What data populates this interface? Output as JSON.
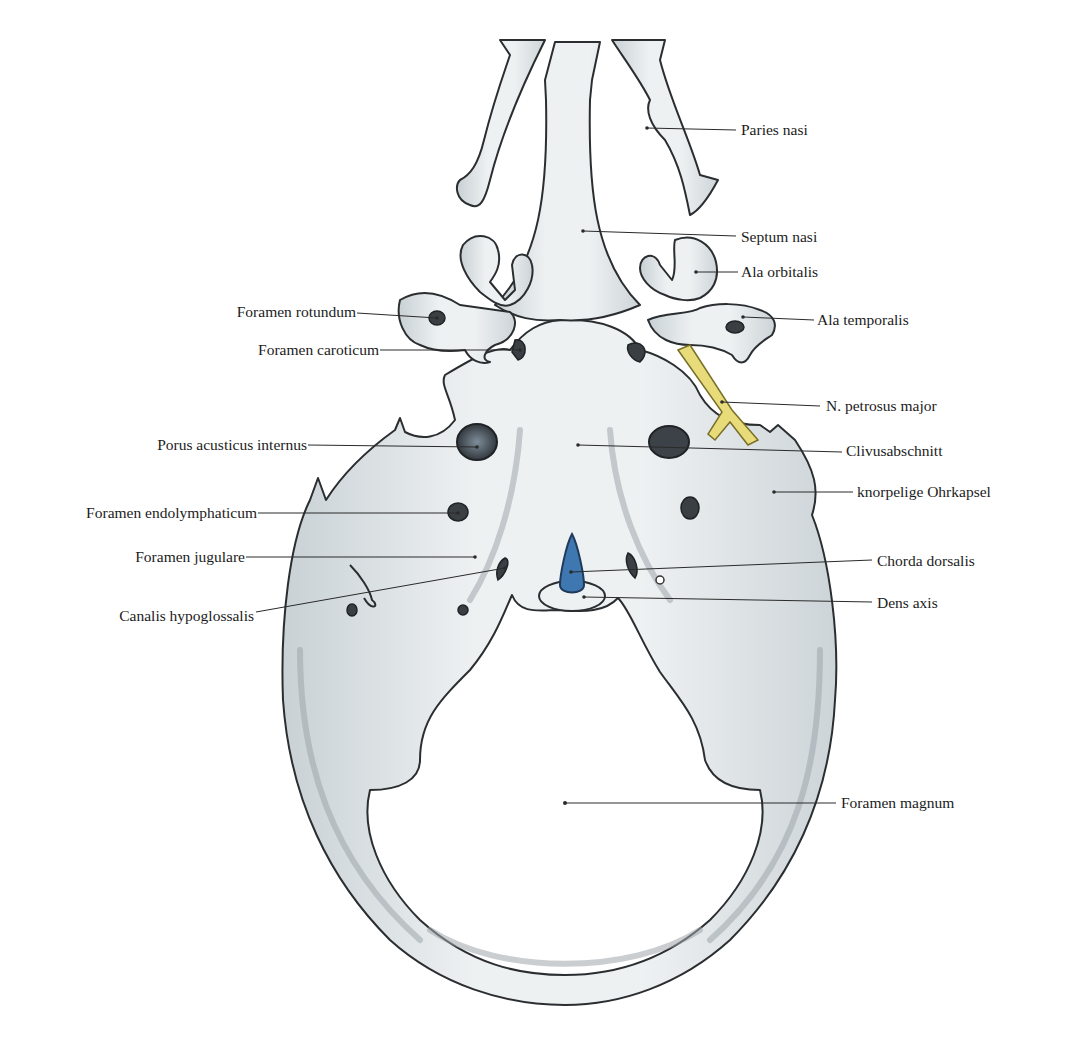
{
  "figure": {
    "colors": {
      "background": "#ffffff",
      "cartilage": "#e7ebed",
      "cartilage_shadow": "#b9c2c7",
      "outline": "#2b2e30",
      "nerve_yellow": "#e8dc7a",
      "chorda_blue": "#3f77b0",
      "label_text": "#1c1c1c"
    }
  },
  "labels": {
    "left": [
      {
        "id": "foramen-rotundum",
        "text": "Foramen rotundum"
      },
      {
        "id": "foramen-caroticum",
        "text": "Foramen caroticum"
      },
      {
        "id": "porus-acusticus-internus",
        "text": "Porus acusticus internus"
      },
      {
        "id": "foramen-endolymphaticum",
        "text": "Foramen endolymphaticum"
      },
      {
        "id": "foramen-jugulare",
        "text": "Foramen jugulare"
      },
      {
        "id": "canalis-hypoglossalis",
        "text": "Canalis hypoglossalis"
      }
    ],
    "right": [
      {
        "id": "paries-nasi",
        "text": "Paries nasi"
      },
      {
        "id": "septum-nasi",
        "text": "Septum nasi"
      },
      {
        "id": "ala-orbitalis",
        "text": "Ala orbitalis"
      },
      {
        "id": "ala-temporalis",
        "text": "Ala temporalis"
      },
      {
        "id": "n-petrosus-major",
        "text": "N. petrosus major"
      },
      {
        "id": "clivusabschnitt",
        "text": "Clivusabschnitt"
      },
      {
        "id": "knorpelige-ohrkapsel",
        "text": "knorpelige Ohrkapsel"
      },
      {
        "id": "chorda-dorsalis",
        "text": "Chorda dorsalis"
      },
      {
        "id": "dens-axis",
        "text": "Dens axis"
      },
      {
        "id": "foramen-magnum",
        "text": "Foramen magnum"
      }
    ]
  }
}
